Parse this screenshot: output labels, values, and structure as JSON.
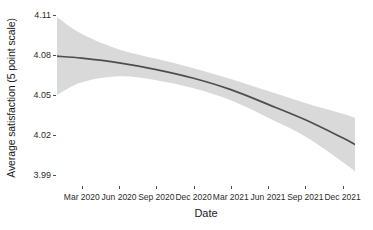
{
  "chart_data": {
    "type": "line",
    "title": "",
    "subtitle": "",
    "xlabel": "Date",
    "ylabel": "Average satisfaction (5 point scale)",
    "grid": false,
    "legend": "none",
    "style": "ggplot2 theme_classic, smoothed trend with 95% confidence ribbon",
    "x_tick_labels": [
      "Mar 2020",
      "Jun 2020",
      "Sep 2020",
      "Dec 2020",
      "Mar 2021",
      "Jun 2021",
      "Sep 2021",
      "Dec 2021"
    ],
    "x_tick_values": [
      "2020-03",
      "2020-06",
      "2020-09",
      "2020-12",
      "2021-03",
      "2021-06",
      "2021-09",
      "2021-12"
    ],
    "y_tick_labels": [
      "4.11",
      "4.08",
      "4.05",
      "4.02",
      "3.99"
    ],
    "y_tick_values": [
      4.11,
      4.08,
      4.05,
      4.02,
      3.99
    ],
    "ylim": [
      3.982,
      4.115
    ],
    "xlim": [
      "2020-01",
      "2022-01"
    ],
    "series": [
      {
        "name": "Average satisfaction (smoothed fit)",
        "color": "#4d4d4d",
        "x": [
          "2020-01",
          "2020-03",
          "2020-06",
          "2020-09",
          "2020-12",
          "2021-03",
          "2021-06",
          "2021-09",
          "2021-12",
          "2022-01"
        ],
        "values": [
          4.079,
          4.0775,
          4.074,
          4.069,
          4.0625,
          4.054,
          4.043,
          4.0315,
          4.018,
          4.013
        ]
      }
    ],
    "ribbon": {
      "name": "95% confidence interval",
      "color": "#d9d9d9",
      "x": [
        "2020-01",
        "2020-03",
        "2020-06",
        "2020-09",
        "2020-12",
        "2021-03",
        "2021-06",
        "2021-09",
        "2021-12",
        "2022-01"
      ],
      "upper": [
        4.108,
        4.0955,
        4.084,
        4.077,
        4.07,
        4.062,
        4.053,
        4.044,
        4.036,
        4.033
      ],
      "lower": [
        4.05,
        4.0595,
        4.064,
        4.061,
        4.055,
        4.046,
        4.033,
        4.019,
        4.0,
        3.993
      ]
    }
  },
  "axes": {
    "y_title": "Average satisfaction (5 point scale)",
    "x_title": "Date"
  }
}
